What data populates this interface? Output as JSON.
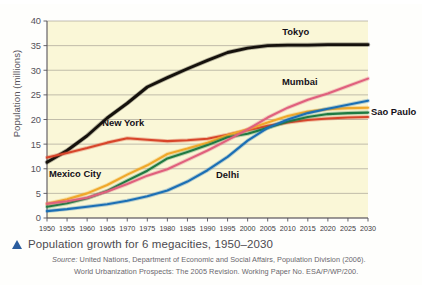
{
  "figure": {
    "caption": "Population growth for 6 megacities, 1950–2030",
    "caption_marker": "triangle-bullet",
    "source_line_1_label": "Source:",
    "source_line_1": " United Nations, Department of Economic and Social Affairs, Population Division (2006).",
    "source_line_2": "World Urbanization Prospects: The 2005 Revision. Working Paper No. ESA/P/WP/200.",
    "plot_background": "#faf7d7",
    "caption_color": "#4c4a50",
    "marker_color": "#2a5d9e"
  },
  "chart_data": {
    "type": "line",
    "title": "",
    "xlabel": "",
    "ylabel": "Population (millions)",
    "xlim": [
      1950,
      2030
    ],
    "ylim": [
      0,
      40
    ],
    "ytick_step": 5,
    "grid": true,
    "grid_axis": "y",
    "legend_position": "inline-labels",
    "x": [
      1950,
      1955,
      1960,
      1965,
      1970,
      1975,
      1980,
      1985,
      1990,
      1995,
      2000,
      2005,
      2010,
      2015,
      2020,
      2025,
      2030
    ],
    "xticklabels": [
      "1950",
      "1955",
      "1960",
      "1965",
      "1970",
      "1975",
      "1980",
      "1985",
      "1990",
      "1995",
      "2000",
      "2005",
      "2010",
      "2015",
      "2020",
      "2025",
      "2030"
    ],
    "yticklabels": [
      "0",
      "5",
      "10",
      "15",
      "20",
      "25",
      "30",
      "35",
      "40"
    ],
    "yticks": [
      0,
      5,
      10,
      15,
      20,
      25,
      30,
      35,
      40
    ],
    "series": [
      {
        "name": "Tokyo",
        "color": "#15110c",
        "label_position": {
          "x": 2012,
          "y": 37.2
        },
        "values": [
          11.3,
          13.7,
          16.7,
          20.3,
          23.3,
          26.6,
          28.5,
          30.3,
          32.0,
          33.6,
          34.5,
          35.0,
          35.1,
          35.1,
          35.2,
          35.2,
          35.2
        ]
      },
      {
        "name": "New York",
        "color": "#d8452a",
        "label_position": {
          "x": 1969,
          "y": 18.6
        },
        "values": [
          12.3,
          13.2,
          14.2,
          15.3,
          16.2,
          15.9,
          15.6,
          15.8,
          16.1,
          16.9,
          17.8,
          18.7,
          19.4,
          19.9,
          20.2,
          20.4,
          20.5
        ]
      },
      {
        "name": "Mexico City",
        "color": "#f0a82a",
        "label_position": {
          "x": 1957,
          "y": 8.4
        },
        "values": [
          2.9,
          3.8,
          5.0,
          6.7,
          8.8,
          10.7,
          13.0,
          14.1,
          15.3,
          16.8,
          18.0,
          19.4,
          20.7,
          21.6,
          22.1,
          22.3,
          22.4
        ]
      },
      {
        "name": "Sao Paulo",
        "color": "#1f7a43",
        "label_position": {
          "x": 2031,
          "y": 20.9
        },
        "values": [
          2.3,
          3.0,
          4.0,
          5.5,
          7.6,
          9.6,
          12.1,
          13.4,
          14.8,
          16.4,
          17.1,
          18.3,
          19.6,
          20.5,
          21.1,
          21.3,
          21.4
        ]
      },
      {
        "name": "Mumbai",
        "color": "#e0607d",
        "label_position": {
          "x": 2013,
          "y": 27.0
        },
        "values": [
          2.9,
          3.4,
          4.1,
          5.4,
          6.9,
          8.6,
          9.9,
          11.8,
          13.7,
          15.8,
          18.0,
          20.4,
          22.4,
          24.0,
          25.3,
          26.8,
          28.3
        ]
      },
      {
        "name": "Delhi",
        "color": "#1b6fb5",
        "label_position": {
          "x": 1995,
          "y": 8.2
        },
        "values": [
          1.4,
          1.8,
          2.3,
          2.8,
          3.5,
          4.4,
          5.6,
          7.4,
          9.7,
          12.4,
          15.7,
          18.3,
          20.0,
          21.3,
          22.2,
          23.0,
          23.8
        ]
      }
    ]
  }
}
